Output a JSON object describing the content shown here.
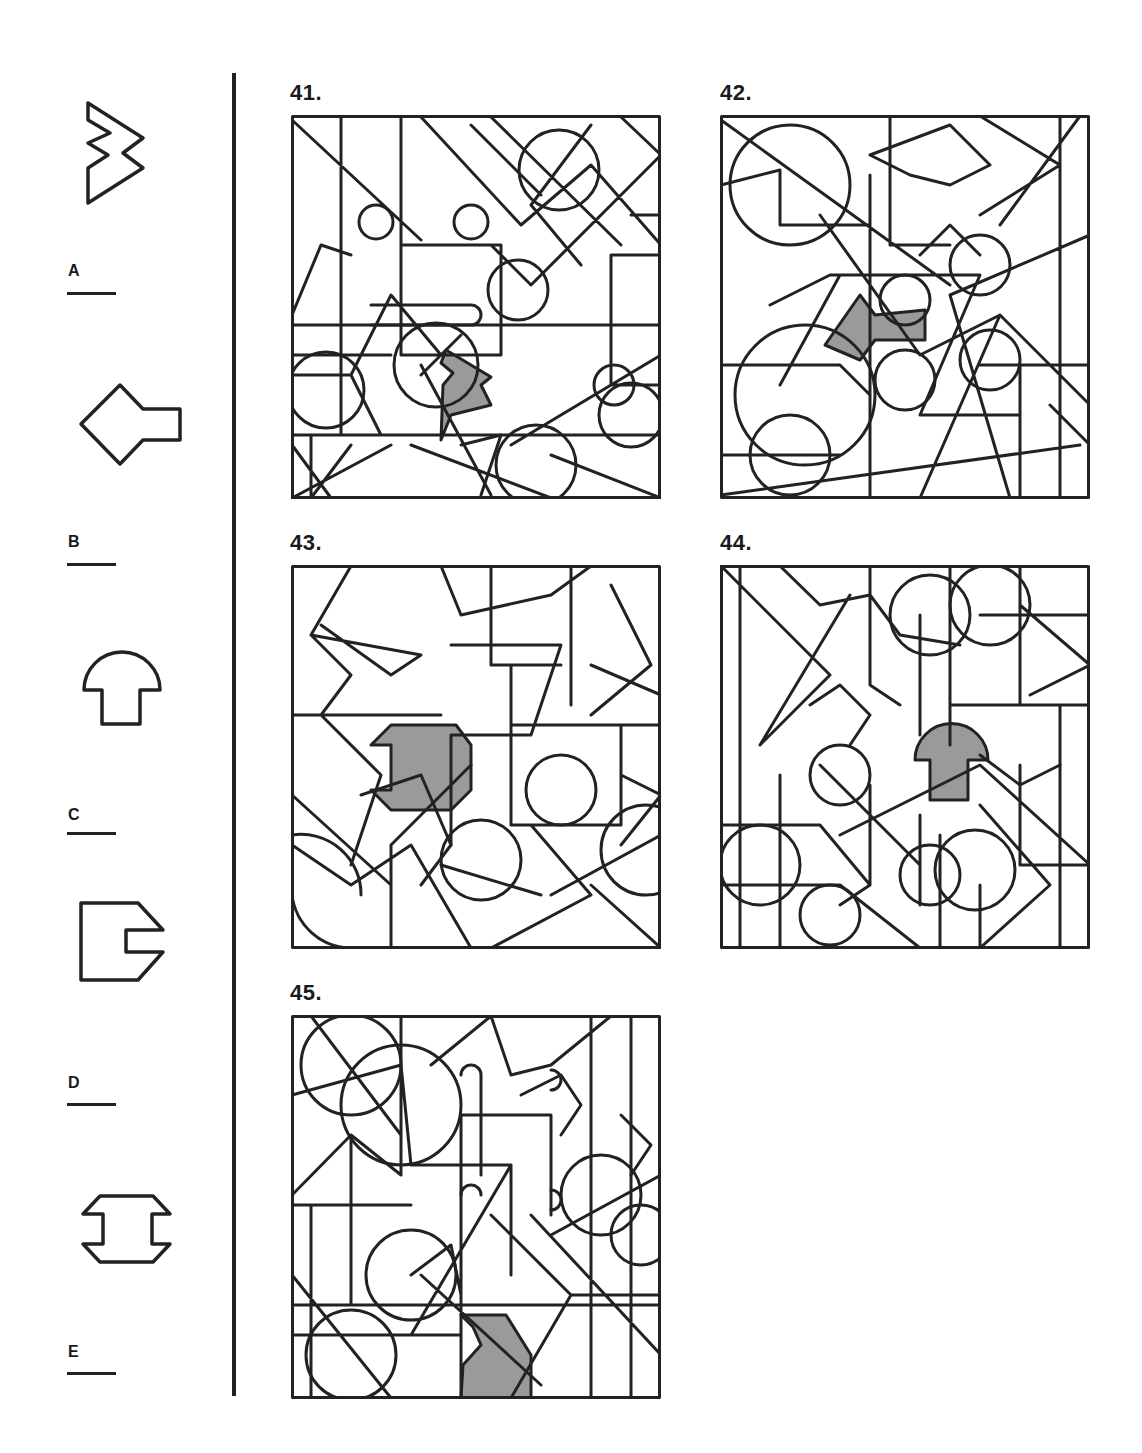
{
  "options": [
    {
      "letter": "A",
      "shape": "double-zigzag-chevron-icon"
    },
    {
      "letter": "B",
      "shape": "diamond-with-tab-icon"
    },
    {
      "letter": "C",
      "shape": "mushroom-icon"
    },
    {
      "letter": "D",
      "shape": "notched-pentagon-icon"
    },
    {
      "letter": "E",
      "shape": "i-beam-octagon-icon"
    }
  ],
  "questions": [
    {
      "number": "41.",
      "highlighted_shape": "zigzag"
    },
    {
      "number": "42.",
      "highlighted_shape": "diamond-with-tab"
    },
    {
      "number": "43.",
      "highlighted_shape": "i-beam-octagon"
    },
    {
      "number": "44.",
      "highlighted_shape": "mushroom"
    },
    {
      "number": "45.",
      "highlighted_shape": "notched-pentagon"
    }
  ],
  "colors": {
    "line": "#222222",
    "highlight": "#9a9a9a",
    "background": "#ffffff"
  }
}
